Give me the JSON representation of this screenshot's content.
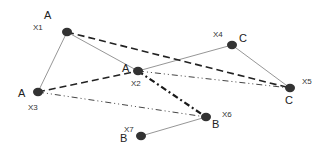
{
  "diagram": {
    "nodes": [
      {
        "id": "X1",
        "label": "A"
      },
      {
        "id": "X2",
        "label": "A"
      },
      {
        "id": "X3",
        "label": "A"
      },
      {
        "id": "X4",
        "label": "C"
      },
      {
        "id": "X5",
        "label": "C"
      },
      {
        "id": "X6",
        "label": "B"
      },
      {
        "id": "X7",
        "label": "B"
      }
    ],
    "edges": [
      {
        "from": "X1",
        "to": "X3",
        "style": "solid"
      },
      {
        "from": "X1",
        "to": "X2",
        "style": "solid"
      },
      {
        "from": "X2",
        "to": "X4",
        "style": "solid"
      },
      {
        "from": "X4",
        "to": "X5",
        "style": "solid"
      },
      {
        "from": "X6",
        "to": "X7",
        "style": "solid"
      },
      {
        "from": "X1",
        "to": "X5",
        "style": "dashed"
      },
      {
        "from": "X3",
        "to": "X2",
        "style": "dashed"
      },
      {
        "from": "X2",
        "to": "X5",
        "style": "dash-dot-dot"
      },
      {
        "from": "X3",
        "to": "X6",
        "style": "dash-dot-dot"
      },
      {
        "from": "X2",
        "to": "X6",
        "style": "thick-dash-dot"
      }
    ]
  }
}
